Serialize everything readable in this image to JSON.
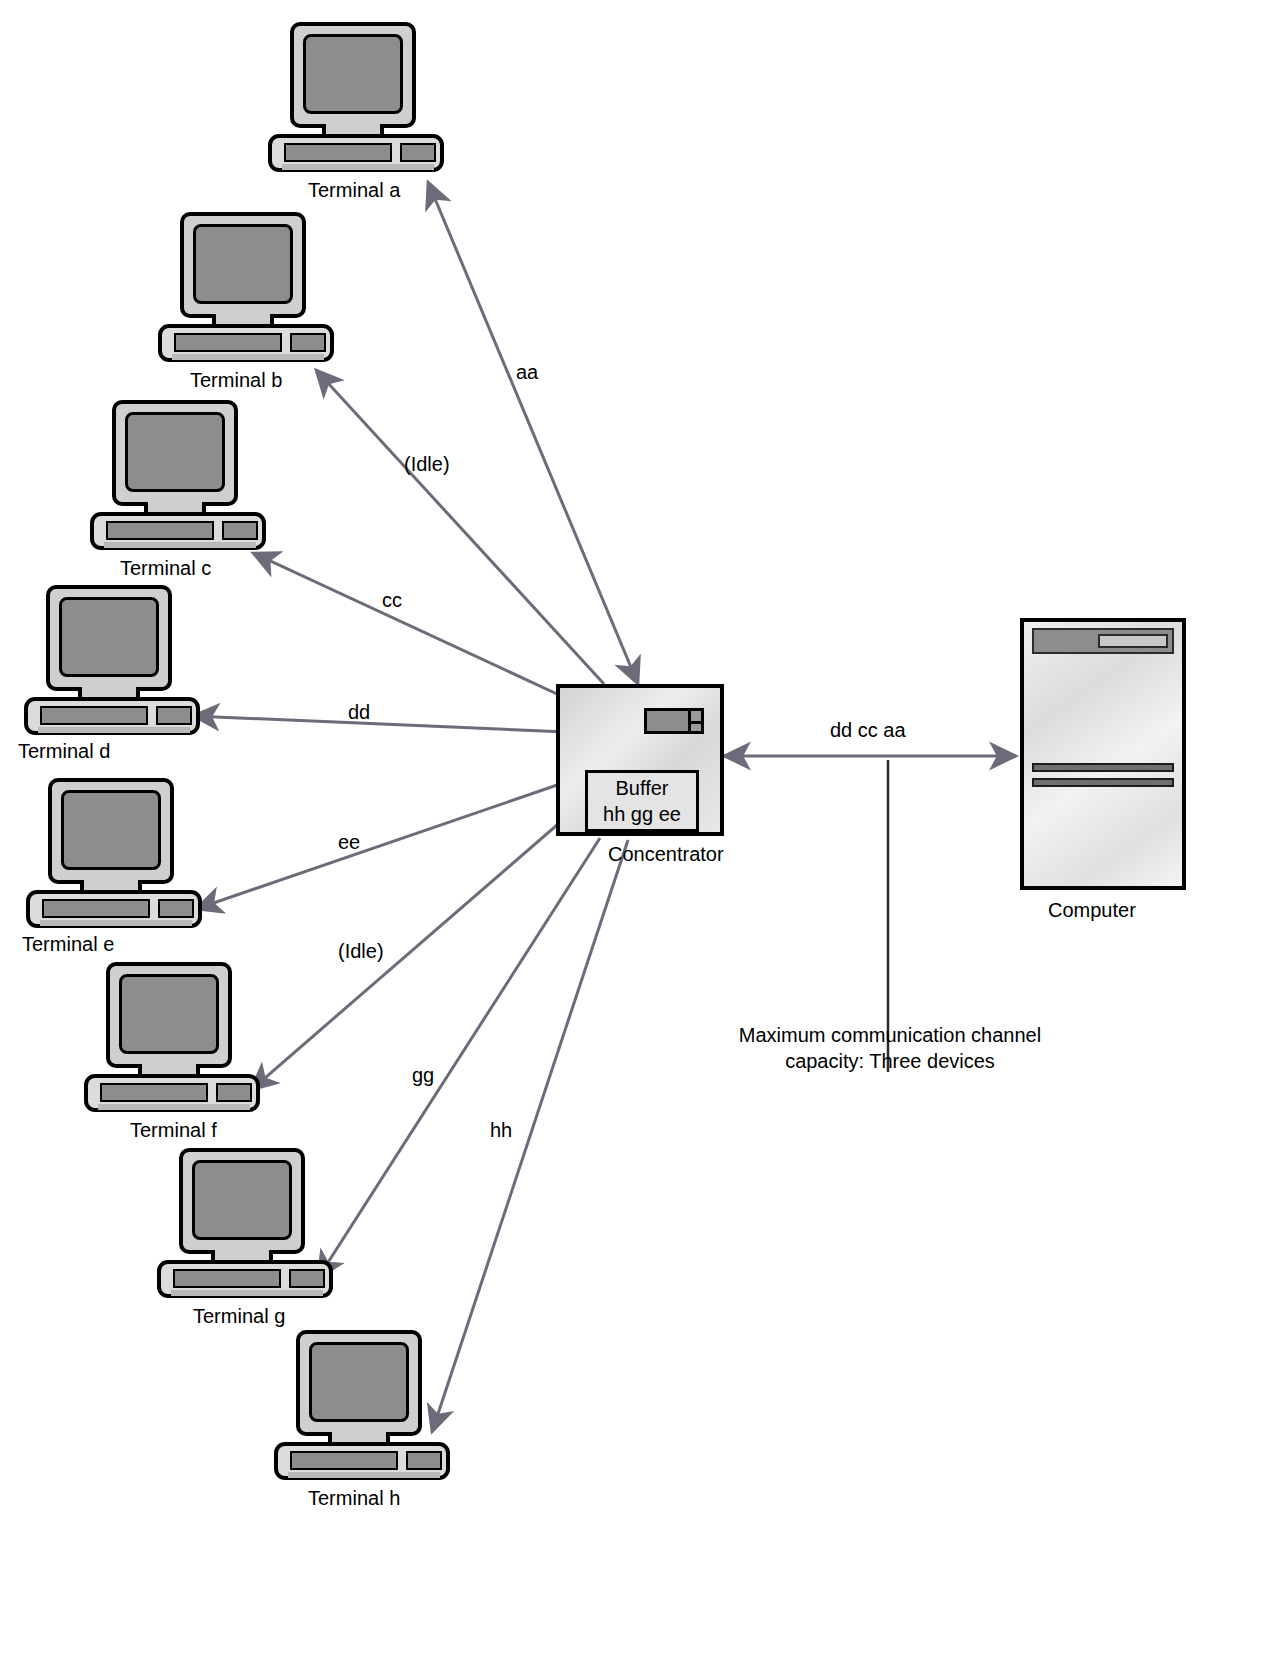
{
  "diagram": {
    "terminals": [
      {
        "id": "a",
        "label": "Terminal a",
        "edge_label": "aa"
      },
      {
        "id": "b",
        "label": "Terminal b",
        "edge_label": "(Idle)"
      },
      {
        "id": "c",
        "label": "Terminal c",
        "edge_label": "cc"
      },
      {
        "id": "d",
        "label": "Terminal d",
        "edge_label": "dd"
      },
      {
        "id": "e",
        "label": "Terminal e",
        "edge_label": "ee"
      },
      {
        "id": "f",
        "label": "Terminal f",
        "edge_label": "(Idle)"
      },
      {
        "id": "g",
        "label": "Terminal g",
        "edge_label": "gg"
      },
      {
        "id": "h",
        "label": "Terminal h",
        "edge_label": "hh"
      }
    ],
    "concentrator": {
      "label": "Concentrator",
      "buffer_title": "Buffer",
      "buffer_contents": "hh gg ee"
    },
    "computer": {
      "label": "Computer"
    },
    "trunk": {
      "edge_label": "dd cc aa",
      "note_line1": "Maximum communication channel",
      "note_line2": "capacity: Three devices"
    },
    "colors": {
      "line": "#6b6b7a",
      "outline": "#000000",
      "screen_fill": "#8d8d8d",
      "case_fill": "#cfcfcf",
      "background": "#ffffff"
    }
  }
}
